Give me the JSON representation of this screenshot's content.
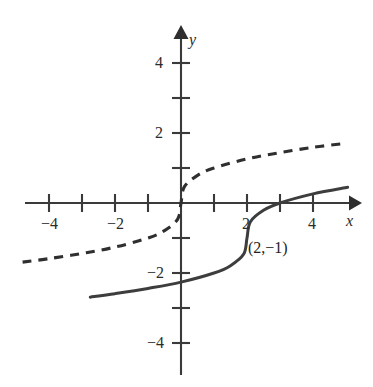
{
  "chart_data": {
    "type": "line",
    "title": "",
    "xlabel": "x",
    "ylabel": "y",
    "xlim": [
      -4.75,
      5.4
    ],
    "ylim": [
      -5.1,
      5.2
    ],
    "grid": false,
    "legend": null,
    "axis_origin_label": "0",
    "x_ticks": [
      -4,
      -3,
      -2,
      -1,
      1,
      2,
      3,
      4
    ],
    "x_tick_labels": [
      "-4",
      "",
      "-2",
      "",
      "",
      "2",
      "",
      "4"
    ],
    "y_ticks": [
      -4,
      -3,
      -2,
      -1,
      1,
      2,
      3,
      4
    ],
    "y_tick_labels": [
      "-4",
      "",
      "-2",
      "",
      "",
      "2",
      "",
      "4"
    ],
    "annotations": [
      {
        "text": "(2,−1)",
        "x": 2,
        "y": -1,
        "describes": "inflection point of solid curve"
      }
    ],
    "series": [
      {
        "name": "solid-curve",
        "style": "solid",
        "equation": "y = cbrt(x - 2) - 1",
        "x_start": -2.75,
        "x_end": 5.05,
        "points": [
          {
            "x": -2.75,
            "y": -2.69
          },
          {
            "x": -2.0,
            "y": -2.59
          },
          {
            "x": -1.0,
            "y": -2.44
          },
          {
            "x": 0.0,
            "y": -2.26
          },
          {
            "x": 1.0,
            "y": -2.0
          },
          {
            "x": 1.5,
            "y": -1.79
          },
          {
            "x": 1.9,
            "y": -1.46
          },
          {
            "x": 2.0,
            "y": -1.0
          },
          {
            "x": 2.1,
            "y": -0.54
          },
          {
            "x": 2.5,
            "y": -0.21
          },
          {
            "x": 3.0,
            "y": 0.0
          },
          {
            "x": 4.0,
            "y": 0.26
          },
          {
            "x": 5.05,
            "y": 0.45
          }
        ]
      },
      {
        "name": "dashed-curve",
        "style": "dashed",
        "equation": "y = cbrt(x)",
        "x_start": -4.8,
        "x_end": 4.85,
        "points": [
          {
            "x": -4.8,
            "y": -1.69
          },
          {
            "x": -4.0,
            "y": -1.59
          },
          {
            "x": -3.0,
            "y": -1.44
          },
          {
            "x": -2.0,
            "y": -1.26
          },
          {
            "x": -1.0,
            "y": -1.0
          },
          {
            "x": -0.5,
            "y": -0.79
          },
          {
            "x": -0.1,
            "y": -0.46
          },
          {
            "x": 0.0,
            "y": 0.0
          },
          {
            "x": 0.1,
            "y": 0.46
          },
          {
            "x": 0.5,
            "y": 0.79
          },
          {
            "x": 1.0,
            "y": 1.0
          },
          {
            "x": 2.0,
            "y": 1.26
          },
          {
            "x": 3.0,
            "y": 1.44
          },
          {
            "x": 4.0,
            "y": 1.59
          },
          {
            "x": 4.85,
            "y": 1.69
          }
        ]
      }
    ]
  },
  "labels": {
    "x_axis_name": "x",
    "y_axis_name": "y",
    "x_neg4": "−4",
    "x_neg2": "−2",
    "x_pos2": "2",
    "x_pos4": "4",
    "y_neg4": "−4",
    "y_neg2": "−2",
    "y_pos2": "2",
    "y_pos4": "4",
    "point_annotation": "(2,−1)"
  },
  "colors": {
    "background": "#ffffff",
    "axis": "#3a3a3a",
    "solid_curve": "#3d3d3d",
    "dashed_curve": "#2f2f2f",
    "text": "#2b2b2b"
  }
}
